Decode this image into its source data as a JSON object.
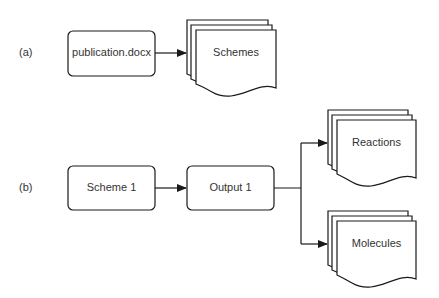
{
  "panels": {
    "a": {
      "label": "(a)",
      "source": "publication.docx",
      "target": "Schemes"
    },
    "b": {
      "label": "(b)",
      "source": "Scheme 1",
      "middle": "Output 1",
      "targets": [
        "Reactions",
        "Molecules"
      ]
    }
  },
  "colors": {
    "stroke": "#1a1a1a",
    "text": "#333333",
    "fill": "#ffffff"
  }
}
